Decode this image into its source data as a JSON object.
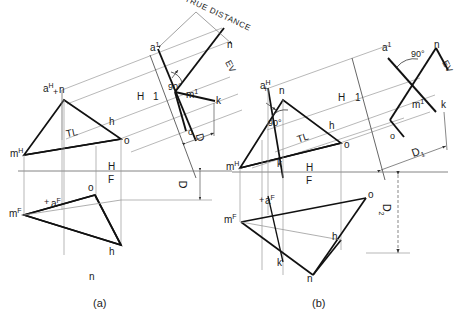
{
  "figure": {
    "type": "descriptive-geometry-orthographic-projection",
    "caption_a": "(a)",
    "caption_b": "(b)",
    "line_colors": {
      "object": "#111111",
      "projector": "#8a8a8a",
      "fold": "#6b6b6b",
      "dimension": "#4a4a4a"
    }
  },
  "panel_a": {
    "name": "(a)",
    "top_view": {
      "point_a": "a",
      "point_a_sup": "H",
      "vertex_m": "m",
      "vertex_m_sup": "H",
      "vertex_n": "n",
      "vertex_o": "o",
      "point_h": "h",
      "true_length": "TL"
    },
    "front_view": {
      "vertex_m": "m",
      "vertex_m_sup": "F",
      "vertex_n": "n",
      "vertex_o": "o",
      "point_h": "h",
      "point_a": "a",
      "point_a_sup": "F"
    },
    "aux_view": {
      "point_a1": "a",
      "point_a1_sup": "1",
      "point_m1": "m",
      "point_m1_sup": "1",
      "point_n": "n",
      "point_k": "k",
      "point_o": "o",
      "angle": "90°",
      "edge_view": "EV"
    },
    "fold_lines": {
      "h_f_h": "H",
      "h_f_f": "F",
      "h_1_h": "H",
      "h_1_1": "1"
    },
    "dimensions": {
      "true_distance": "TRUE DISTANCE",
      "d_aux": "D",
      "d_front": "D"
    }
  },
  "panel_b": {
    "name": "(b)",
    "top_view": {
      "point_a": "a",
      "point_a_sup": "H",
      "vertex_m": "m",
      "vertex_m_sup": "H",
      "vertex_n": "n",
      "vertex_o": "o",
      "point_h": "h",
      "point_k": "k",
      "angle": "90°",
      "true_length": "TL"
    },
    "front_view": {
      "vertex_m": "m",
      "vertex_m_sup": "F",
      "vertex_n": "n",
      "vertex_o": "o",
      "point_h": "h",
      "point_k": "k",
      "point_a": "a",
      "point_a_sup": "F"
    },
    "aux_view": {
      "point_a1": "a",
      "point_a1_sup": "1",
      "point_m1": "m",
      "point_m1_sup": "1",
      "point_n": "n",
      "point_k": "k",
      "point_o": "o",
      "angle": "90°",
      "edge_view": "EV"
    },
    "fold_lines": {
      "h_f_h": "H",
      "h_f_f": "F",
      "h_1_h": "H",
      "h_1_1": "1"
    },
    "dimensions": {
      "d1": "D",
      "d1_sub": "1",
      "d2": "D",
      "d2_sub": "2"
    }
  }
}
